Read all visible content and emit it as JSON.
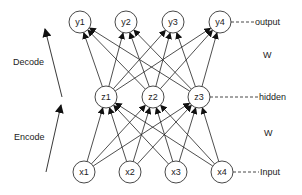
{
  "diagram": {
    "type": "autoencoder-network",
    "layers": {
      "output": {
        "label": "output",
        "nodes": [
          {
            "id": "y1",
            "label": "y1",
            "x": 80,
            "y": 22
          },
          {
            "id": "y2",
            "label": "y2",
            "x": 126,
            "y": 22
          },
          {
            "id": "y3",
            "label": "y3",
            "x": 173,
            "y": 22
          },
          {
            "id": "y4",
            "label": "y4",
            "x": 220,
            "y": 22
          }
        ]
      },
      "hidden": {
        "label": "hidden",
        "nodes": [
          {
            "id": "z1",
            "label": "z1",
            "x": 106,
            "y": 97
          },
          {
            "id": "z2",
            "label": "z2",
            "x": 153,
            "y": 97
          },
          {
            "id": "z3",
            "label": "z3",
            "x": 199,
            "y": 97
          }
        ]
      },
      "input": {
        "label": "Input",
        "nodes": [
          {
            "id": "x1",
            "label": "x1",
            "x": 84,
            "y": 172
          },
          {
            "id": "x2",
            "label": "x2",
            "x": 130,
            "y": 172
          },
          {
            "id": "x3",
            "label": "x3",
            "x": 176,
            "y": 172
          },
          {
            "id": "x4",
            "label": "x4",
            "x": 222,
            "y": 172
          }
        ]
      }
    },
    "node_radius": 11,
    "connections": [
      {
        "from": "input",
        "to": "hidden",
        "type": "fully-connected",
        "weight_label": "W"
      },
      {
        "from": "hidden",
        "to": "output",
        "type": "fully-connected",
        "weight_label": "W"
      }
    ],
    "side_labels": {
      "decode": "Decode",
      "encode": "Encode"
    },
    "weight_labels": {
      "upper": "W",
      "lower": "W"
    }
  }
}
